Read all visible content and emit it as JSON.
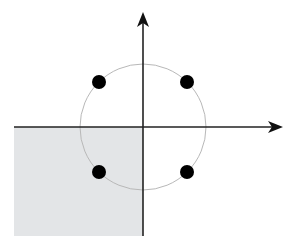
{
  "diagram": {
    "type": "constellation-complex-plane",
    "colors": {
      "background": "#ffffff",
      "axis": "#222222",
      "circle": "#b8b8b8",
      "shaded_region": "#e3e5e7",
      "points": "#000000"
    },
    "origin": {
      "x": 143,
      "y": 127
    },
    "x_axis": {
      "x_start": 14,
      "x_end": 281
    },
    "y_axis": {
      "y_start": 236,
      "y_end": 12
    },
    "circle_radius": 63,
    "shaded_region": {
      "x": 14,
      "y": 127,
      "width": 129,
      "height": 109,
      "quadrant": "third"
    },
    "points": [
      {
        "quadrant": "I",
        "x": 187,
        "y": 82
      },
      {
        "quadrant": "II",
        "x": 99,
        "y": 82
      },
      {
        "quadrant": "III",
        "x": 99,
        "y": 172
      },
      {
        "quadrant": "IV",
        "x": 187,
        "y": 172
      }
    ],
    "point_radius": 7
  }
}
